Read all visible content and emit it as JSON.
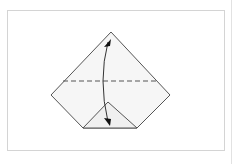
{
  "diagram": {
    "type": "origami-fold-step",
    "colors": {
      "paper": "#f4f4f4",
      "line": "#555555",
      "frame": "#d4d4d4"
    },
    "elements": [
      {
        "kind": "paper-outline",
        "shape": "pentagon-diamond"
      },
      {
        "kind": "valley-fold-line",
        "style": "dashed"
      },
      {
        "kind": "inner-flap",
        "shape": "triangle"
      },
      {
        "kind": "fold-arrow",
        "direction": "up-and-back",
        "heads": 2
      }
    ]
  }
}
